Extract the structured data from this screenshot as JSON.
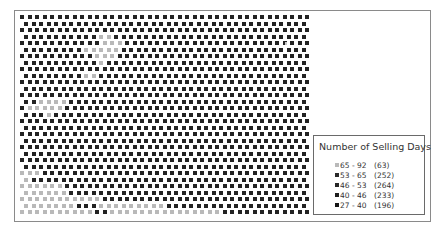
{
  "legend": {
    "title": "Number of Selling Days",
    "items": [
      {
        "range": "65 - 92",
        "count": "(63)",
        "color": "#b9b9b9"
      },
      {
        "range": "53 - 65",
        "count": "(252)",
        "color": "#2a2a2a"
      },
      {
        "range": "46 - 53",
        "count": "(264)",
        "color": "#262626"
      },
      {
        "range": "40 - 46",
        "count": "(233)",
        "color": "#1e1e1e"
      },
      {
        "range": "27 - 40",
        "count": "(196)",
        "color": "#151515"
      }
    ]
  },
  "grid": {
    "origin_x": 20,
    "origin_y": 15,
    "col_pitch": 7.5,
    "row_pitch": 6.5,
    "cols": 39,
    "rows": 31,
    "light_color": "#b9b9b9",
    "mid_color": "#8c8c8c",
    "dark_color": "#222222",
    "light_cells": [
      [
        3,
        11
      ],
      [
        3,
        12
      ],
      [
        4,
        11
      ],
      [
        4,
        12
      ],
      [
        4,
        13
      ],
      [
        5,
        9
      ],
      [
        5,
        10
      ],
      [
        5,
        11
      ],
      [
        5,
        12
      ],
      [
        5,
        13
      ],
      [
        6,
        10
      ],
      [
        6,
        11
      ],
      [
        6,
        12
      ],
      [
        7,
        11
      ],
      [
        9,
        9
      ],
      [
        9,
        10
      ],
      [
        13,
        3
      ],
      [
        13,
        4
      ],
      [
        13,
        5
      ],
      [
        13,
        6
      ],
      [
        14,
        1
      ],
      [
        14,
        2
      ],
      [
        14,
        3
      ],
      [
        14,
        4
      ],
      [
        14,
        5
      ],
      [
        15,
        4
      ],
      [
        24,
        0
      ],
      [
        24,
        1
      ],
      [
        24,
        2
      ],
      [
        25,
        0
      ],
      [
        25,
        1
      ],
      [
        26,
        0
      ],
      [
        26,
        1
      ],
      [
        26,
        2
      ],
      [
        26,
        3
      ],
      [
        26,
        4
      ],
      [
        26,
        5
      ],
      [
        27,
        0
      ],
      [
        27,
        1
      ],
      [
        27,
        2
      ],
      [
        27,
        3
      ],
      [
        27,
        4
      ],
      [
        27,
        5
      ],
      [
        27,
        6
      ],
      [
        28,
        0
      ],
      [
        28,
        1
      ],
      [
        28,
        2
      ],
      [
        28,
        3
      ],
      [
        28,
        4
      ],
      [
        28,
        5
      ],
      [
        28,
        6
      ],
      [
        28,
        7
      ],
      [
        28,
        8
      ],
      [
        28,
        9
      ],
      [
        28,
        10
      ],
      [
        29,
        0
      ],
      [
        29,
        1
      ],
      [
        29,
        2
      ],
      [
        29,
        3
      ],
      [
        29,
        4
      ],
      [
        29,
        5
      ],
      [
        29,
        6
      ],
      [
        29,
        7
      ],
      [
        29,
        11
      ],
      [
        29,
        12
      ],
      [
        29,
        13
      ],
      [
        29,
        14
      ],
      [
        29,
        15
      ],
      [
        29,
        16
      ],
      [
        29,
        17
      ],
      [
        29,
        18
      ],
      [
        29,
        19
      ],
      [
        30,
        0
      ],
      [
        30,
        1
      ],
      [
        30,
        2
      ],
      [
        30,
        3
      ],
      [
        30,
        4
      ],
      [
        30,
        5
      ],
      [
        30,
        6
      ],
      [
        30,
        7
      ],
      [
        30,
        8
      ],
      [
        30,
        9
      ],
      [
        30,
        12
      ],
      [
        30,
        13
      ],
      [
        30,
        14
      ],
      [
        30,
        15
      ],
      [
        30,
        16
      ],
      [
        30,
        17
      ],
      [
        30,
        18
      ],
      [
        30,
        19
      ],
      [
        30,
        20
      ],
      [
        30,
        21
      ],
      [
        30,
        22
      ],
      [
        30,
        23
      ],
      [
        30,
        24
      ],
      [
        30,
        25
      ],
      [
        30,
        26
      ]
    ],
    "legend_cutout": {
      "col_min": 38,
      "row_min": 19
    }
  }
}
